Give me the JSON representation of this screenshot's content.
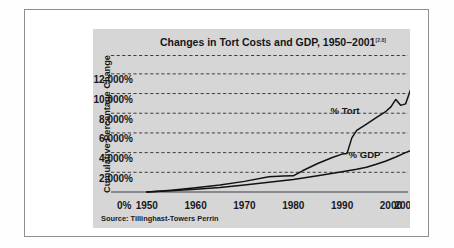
{
  "figure": {
    "source_note": "Source: Tillinghast-Towers Perrin",
    "title_main": "Changes in Tort Costs and GDP, 1950–2001",
    "title_superscript": "[2.8]",
    "panel_color": "#d6d6d6",
    "line_color": "#111216",
    "frame_color": "#8e8e8e"
  },
  "chart_data": {
    "type": "line",
    "title": "Changes in Tort Costs and GDP, 1950–2001",
    "xlabel": "",
    "ylabel": "Cumulative Percentage Change",
    "ylim": [
      0,
      13000
    ],
    "xlim": [
      1948,
      2003.5
    ],
    "grid": true,
    "legend_position": "inline-annotation",
    "ytick_labels": [
      "2,000%",
      "4,000%",
      "6,000%",
      "8,000%",
      "10,000%",
      "12,000%"
    ],
    "ytick_values": [
      2000,
      4000,
      6000,
      8000,
      10000,
      12000
    ],
    "xtick_labels": [
      "0%",
      "1950",
      "1960",
      "1970",
      "1980",
      "1990",
      "2000",
      "2001"
    ],
    "xtick_values": [
      1945.4,
      1950,
      1960,
      1970,
      1980,
      1990,
      2000,
      2003
    ],
    "series": [
      {
        "name": "% Tort",
        "label": "% Tort",
        "x": [
          1950,
          1955,
          1960,
          1965,
          1970,
          1975,
          1978,
          1980,
          1982,
          1985,
          1988,
          1990,
          1991,
          1992,
          1993,
          1995,
          1997,
          1999,
          2000,
          2001,
          2002,
          2003,
          2004,
          2005
        ],
        "values": [
          0,
          190,
          420,
          700,
          1080,
          1560,
          1620,
          1640,
          2180,
          2900,
          3500,
          3850,
          3900,
          5500,
          6250,
          6900,
          7550,
          8200,
          8650,
          9400,
          8800,
          8950,
          10350,
          11900
        ]
      },
      {
        "name": "% GDP",
        "label": "% GDP",
        "x": [
          1950,
          1955,
          1960,
          1965,
          1970,
          1975,
          1980,
          1985,
          1990,
          1993,
          1995,
          1997,
          1999,
          2000,
          2001,
          2003,
          2005
        ],
        "values": [
          0,
          130,
          280,
          460,
          700,
          980,
          1280,
          1650,
          2050,
          2300,
          2520,
          2820,
          3150,
          3350,
          3550,
          4000,
          4400
        ]
      }
    ],
    "annotations": [
      {
        "text": "% Tort",
        "x": 1990.6,
        "y": 7900
      },
      {
        "text": "% GDP",
        "x": 1994.6,
        "y": 3500
      }
    ]
  }
}
